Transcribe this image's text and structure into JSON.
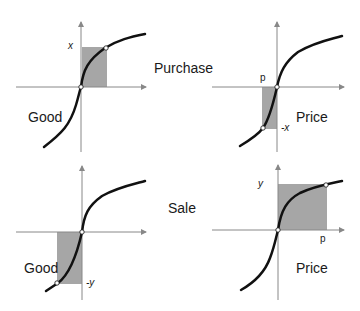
{
  "figure": {
    "center_labels": {
      "purchase": "Purchase",
      "sale": "Sale"
    },
    "panels": [
      {
        "id": "purchase-good",
        "axis_label": "Good",
        "marker_label": "x",
        "shaded": "x positive area"
      },
      {
        "id": "purchase-price",
        "axis_label": "Price",
        "marker_label_x": "p",
        "marker_label_y": "-x",
        "shaded": "negative price area"
      },
      {
        "id": "sale-good",
        "axis_label": "Good",
        "marker_label": "-y",
        "shaded": "negative good area"
      },
      {
        "id": "sale-price",
        "axis_label": "Price",
        "marker_label_x": "p",
        "marker_label_y": "y",
        "shaded": "positive price area"
      }
    ],
    "colors": {
      "curve": "#111111",
      "axis": "#888888",
      "shade": "#a6a6a6",
      "point": "#ffffff"
    }
  }
}
